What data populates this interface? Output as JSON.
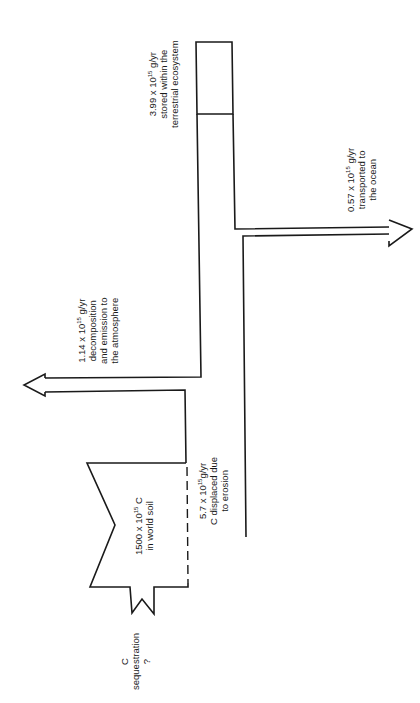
{
  "diagram": {
    "orientation": "rotated-90",
    "nodes": {
      "soil_pool": {
        "value": "1500 x 10",
        "exp": "15",
        "unit": " C",
        "line2": "in world soil"
      },
      "sequestration": {
        "line1": "C",
        "line2": "sequestration",
        "line3": "?"
      }
    },
    "flows": {
      "erosion": {
        "value": "5.7 x 10",
        "exp": "15",
        "unit": "g/yr",
        "line2": "C displaced due",
        "line3": "to erosion"
      },
      "atmosphere": {
        "value": "1.14 x 10",
        "exp": "15",
        "unit": " g/yr",
        "line2": "decomposition",
        "line3": "and emission to",
        "line4": "the atmosphere"
      },
      "terrestrial": {
        "value": "3.99 x 10",
        "exp": "15",
        "unit": " g/yr",
        "line2": "stored within the",
        "line3": "terrestrial ecosystem"
      },
      "ocean": {
        "value": "0.57 x 10",
        "exp": "15",
        "unit": " g/yr",
        "line2": "transported to",
        "line3": "the ocean"
      }
    },
    "stroke_color": "#1a1a1a"
  }
}
